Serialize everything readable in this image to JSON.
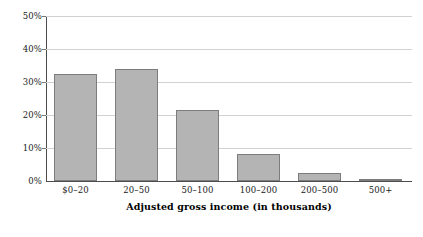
{
  "chart_data": {
    "type": "bar",
    "title": "",
    "subtitle": "",
    "xlabel": "Adjusted gross income (in thousands)",
    "ylabel": "",
    "categories": [
      "$0–20",
      "20–50",
      "50–100",
      "100–200",
      "200–500",
      "500+"
    ],
    "values": [
      32.5,
      34.0,
      21.5,
      8.3,
      2.3,
      0.6
    ],
    "value_labels": [
      "",
      "",
      "",
      "",
      "",
      ""
    ],
    "ylim": [
      0,
      50
    ],
    "ytick_values": [
      0,
      10,
      20,
      30,
      40,
      50
    ],
    "ytick_labels": [
      "0%",
      "10%",
      "20%",
      "30%",
      "40%",
      "50%"
    ],
    "grid": true,
    "grid_axis": "y",
    "legend": false,
    "legend_position": "none",
    "series": [
      {
        "name": "Share of returns",
        "values": [
          32.5,
          34.0,
          21.5,
          8.3,
          2.3,
          0.6
        ]
      }
    ],
    "colors": {
      "bar_fill": "#b4b4b4",
      "bar_border": "#7d7d7d",
      "gridline": "#d2d2d2",
      "axis": "#4d4d4d",
      "background": "#ffffff",
      "text": "#1a1a1a"
    }
  }
}
